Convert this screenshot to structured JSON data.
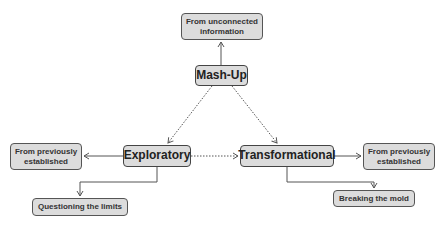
{
  "diagram": {
    "type": "concept-map",
    "colors": {
      "node_fill": "#dcdcdc",
      "node_border": "#555555",
      "edge": "#555555",
      "background": "#ffffff"
    },
    "nodes": {
      "mashup": {
        "label": "Mash-Up"
      },
      "mashup_source": {
        "label": "From unconnected information"
      },
      "exploratory": {
        "label": "Exploratory"
      },
      "exploratory_source": {
        "label": "From previously established"
      },
      "exploratory_result": {
        "label": "Questioning the limits"
      },
      "transformational": {
        "label": "Transformational"
      },
      "transformational_source": {
        "label": "From previously established"
      },
      "transformational_result": {
        "label": "Breaking the mold"
      }
    },
    "edges": [
      {
        "from": "Mash-Up",
        "to": "From unconnected information",
        "style": "solid"
      },
      {
        "from": "Mash-Up",
        "to": "Exploratory",
        "style": "dotted"
      },
      {
        "from": "Mash-Up",
        "to": "Transformational",
        "style": "dotted"
      },
      {
        "from": "Exploratory",
        "to": "Transformational",
        "style": "dotted"
      },
      {
        "from": "Exploratory",
        "to": "From previously established",
        "style": "solid"
      },
      {
        "from": "Exploratory",
        "to": "Questioning the limits",
        "style": "solid"
      },
      {
        "from": "Transformational",
        "to": "From previously established",
        "style": "solid"
      },
      {
        "from": "Transformational",
        "to": "Breaking the mold",
        "style": "solid"
      }
    ]
  }
}
